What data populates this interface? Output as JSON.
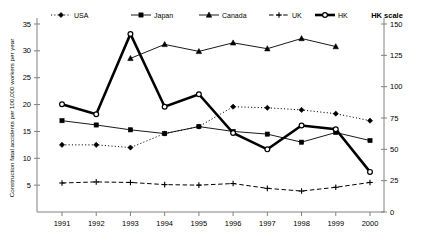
{
  "chart_data": {
    "type": "line",
    "title": "",
    "xlabel": "",
    "ylabel": "Construction fatal accidents per 100,000 workers per year",
    "y2label": "HK scale",
    "categories": [
      "1991",
      "1992",
      "1993",
      "1994",
      "1995",
      "1996",
      "1997",
      "1998",
      "1999",
      "2000"
    ],
    "xticklabels": [
      "1991",
      "1992",
      "1993",
      "1994",
      "1995",
      "1996",
      "1997",
      "1998",
      "1999",
      "2000"
    ],
    "yticklabels": [
      "5",
      "10",
      "15",
      "20",
      "25",
      "30",
      "35"
    ],
    "yticks": [
      5,
      10,
      15,
      20,
      25,
      30,
      35
    ],
    "ylim": [
      0,
      35
    ],
    "y2ticklabels": [
      "0",
      "25",
      "50",
      "75",
      "100",
      "125",
      "150"
    ],
    "y2ticks": [
      0,
      25,
      50,
      75,
      100,
      125,
      150
    ],
    "y2lim": [
      0,
      150
    ],
    "grid": false,
    "legend_position": "top",
    "series": [
      {
        "name": "USA",
        "axis": "left",
        "marker": "diamond",
        "linestyle": "dotted",
        "values": [
          12.5,
          12.5,
          12.0,
          14.6,
          15.9,
          19.6,
          19.4,
          19.0,
          18.3,
          17.0
        ]
      },
      {
        "name": "Japan",
        "axis": "left",
        "marker": "square",
        "linestyle": "solid",
        "values": [
          17.0,
          16.2,
          15.3,
          14.6,
          15.9,
          15.0,
          14.5,
          13.0,
          14.8,
          13.3
        ]
      },
      {
        "name": "Canada",
        "axis": "left",
        "marker": "triangle",
        "linestyle": "solid",
        "values": [
          null,
          null,
          28.6,
          31.2,
          29.9,
          31.5,
          30.4,
          32.3,
          30.8,
          null
        ]
      },
      {
        "name": "UK",
        "axis": "left",
        "marker": "plus",
        "linestyle": "dashed",
        "values": [
          5.4,
          5.6,
          5.5,
          5.1,
          5.0,
          5.3,
          4.4,
          3.9,
          4.6,
          5.5
        ]
      },
      {
        "name": "HK",
        "axis": "right",
        "marker": "circle",
        "linestyle": "solid-thick",
        "values": [
          86,
          78,
          142,
          84,
          94,
          63,
          50,
          69,
          66,
          32
        ]
      }
    ]
  },
  "legend": {
    "items": [
      {
        "label": "USA",
        "key": "usa"
      },
      {
        "label": "Japan",
        "key": "japan"
      },
      {
        "label": "Canada",
        "key": "canada"
      },
      {
        "label": "UK",
        "key": "uk"
      },
      {
        "label": "HK",
        "key": "hk"
      }
    ],
    "hk_scale_label": "HK scale"
  },
  "colors": {
    "axis": "#808080",
    "ink": "#000000",
    "background": "#ffffff"
  }
}
